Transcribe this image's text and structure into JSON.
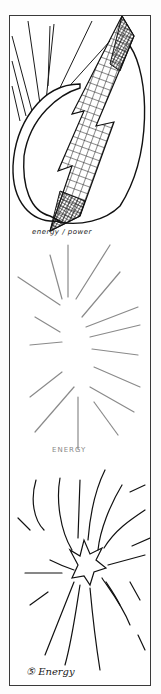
{
  "panels": [
    {
      "id": 1,
      "caption": "energy / power",
      "subject": "lightning bolt with crosshatch fill over a leaf/egg shape with radiating lines"
    },
    {
      "id": 2,
      "caption": "ENERGY",
      "subject": "faint pencil burst of radiating strokes"
    },
    {
      "id": 3,
      "caption": "⑤ Energy",
      "subject": "starburst explosion with curved radiating strokes"
    }
  ],
  "colors": {
    "ink": "#1a1a1a",
    "pencil": "#9a9a9a",
    "border": "#3a3a3a",
    "paper": "#ffffff"
  }
}
